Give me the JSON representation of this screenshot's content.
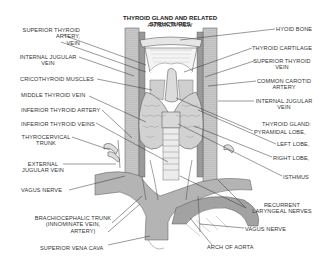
{
  "diagram": {
    "title": "THYROID GLAND AND RELATED STRUCTURES",
    "subtitle": "ANTERIOR VIEW",
    "colors": {
      "background": "#ffffff",
      "vessel_fill": "#a9a9a9",
      "vessel_dark": "#8c8c8c",
      "gland_fill": "#d6d6d6",
      "cartilage_fill": "#f2f2f2",
      "line": "#3a3a3a",
      "text": "#333333"
    },
    "labels_left": [
      {
        "id": "superior-thyroid-artery-vein",
        "lines": [
          "SUPERIOR THYROID",
          "ARTERY,",
          "VEIN"
        ]
      },
      {
        "id": "internal-jugular-vein-left",
        "lines": [
          "INTERNAL JUGULAR",
          "VEIN"
        ]
      },
      {
        "id": "cricothyroid-muscles",
        "lines": [
          "CRICOTHYROID MUSCLES"
        ]
      },
      {
        "id": "middle-thyroid-vein",
        "lines": [
          "MIDDLE THYROID VEIN"
        ]
      },
      {
        "id": "inferior-thyroid-artery",
        "lines": [
          "INFERIOR THYROID ARTERY"
        ]
      },
      {
        "id": "inferior-thyroid-veins",
        "lines": [
          "INFERIOR THYROID VEINS"
        ]
      },
      {
        "id": "thyrocervical-trunk",
        "lines": [
          "THYROCERVICAL",
          "TRUNK"
        ]
      },
      {
        "id": "external-jugular-vein",
        "lines": [
          "EXTERNAL",
          "JUGULAR VEIN"
        ]
      },
      {
        "id": "vagus-nerve-left",
        "lines": [
          "VAGUS NERVE"
        ]
      },
      {
        "id": "brachiocephalic-trunk",
        "lines": [
          "BRACHIOCEPHALIC TRUNK",
          "(INNOMINATE VEIN,",
          "ARTERY)"
        ]
      },
      {
        "id": "superior-vena-cava",
        "lines": [
          "SUPERIOR VENA CAVA"
        ]
      }
    ],
    "labels_right": [
      {
        "id": "hyoid-bone",
        "lines": [
          "HYOID BONE"
        ]
      },
      {
        "id": "thyroid-cartilage",
        "lines": [
          "THYROID CARTILAGE"
        ]
      },
      {
        "id": "superior-thyroid-vein",
        "lines": [
          "SUPERIOR THYROID",
          "VEIN"
        ]
      },
      {
        "id": "common-carotid-artery",
        "lines": [
          "COMMON CAROTID",
          "ARTERY"
        ]
      },
      {
        "id": "internal-jugular-vein-right",
        "lines": [
          "INTERNAL JUGULAR",
          "VEIN"
        ]
      },
      {
        "id": "thyroid-gland",
        "lines": [
          "THYROID GLAND:"
        ]
      },
      {
        "id": "pyramidal-lobe",
        "lines": [
          "PYRAMIDAL LOBE,"
        ]
      },
      {
        "id": "left-lobe",
        "lines": [
          "LEFT LOBE,"
        ]
      },
      {
        "id": "right-lobe",
        "lines": [
          "RIGHT LOBE,"
        ]
      },
      {
        "id": "isthmus",
        "lines": [
          "ISTHMUS"
        ]
      },
      {
        "id": "recurrent-laryngeal-nerves",
        "lines": [
          "RECURRENT",
          "LARYNGEAL NERVES"
        ]
      },
      {
        "id": "vagus-nerve-right",
        "lines": [
          "VAGUS NERVE"
        ]
      },
      {
        "id": "arch-of-aorta",
        "lines": [
          "ARCH OF AORTA"
        ]
      }
    ]
  }
}
